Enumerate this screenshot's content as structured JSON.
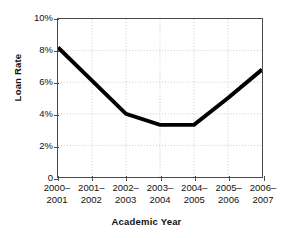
{
  "chart_data": {
    "type": "line",
    "title": "",
    "xlabel": "Academic Year",
    "ylabel": "Loan Rate",
    "categories": [
      "2000–2001",
      "2001–2002",
      "2002–2003",
      "2003–2004",
      "2004–2005",
      "2005–2006",
      "2006–2007"
    ],
    "categories_line1": [
      "2000–",
      "2001–",
      "2002–",
      "2003–",
      "2004–",
      "2005–",
      "2006–"
    ],
    "categories_line2": [
      "2001",
      "2002",
      "2003",
      "2004",
      "2005",
      "2006",
      "2007"
    ],
    "values": [
      8.2,
      6.1,
      4.0,
      3.3,
      3.3,
      5.0,
      6.8
    ],
    "ylim": [
      0,
      10
    ],
    "yticks": [
      0,
      2,
      4,
      6,
      8,
      10
    ],
    "ytick_labels": [
      "0",
      "2%",
      "4%",
      "6%",
      "8%",
      "10%"
    ],
    "grid": true,
    "grid_style": "dotted",
    "grid_color": "#c9c9c9",
    "legend": null,
    "series_color": "#000000",
    "series_width": 4,
    "axis_color": "#4a4a4a",
    "background": "#ffffff"
  }
}
